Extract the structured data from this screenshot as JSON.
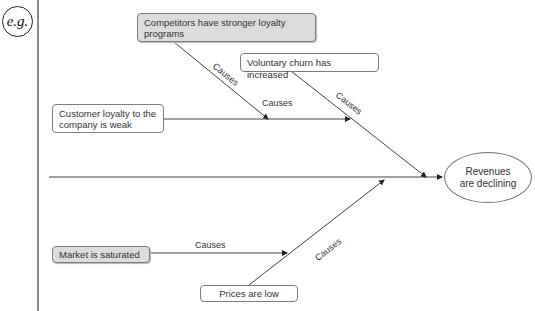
{
  "badge": {
    "text": "e.g."
  },
  "diagram": {
    "type": "fishbone",
    "effect": "Revenues are declining",
    "causes": [
      {
        "id": "competitors",
        "text": "Competitors have stronger loyalty programs",
        "style": "gray"
      },
      {
        "id": "churn",
        "text": "Voluntary churn has increased",
        "style": "white"
      },
      {
        "id": "loyalty",
        "text": "Customer loyalty to the company is weak",
        "style": "white"
      },
      {
        "id": "market",
        "text": "Market is saturated",
        "style": "gray"
      },
      {
        "id": "prices",
        "text": "Prices are low",
        "style": "white"
      }
    ],
    "edge_labels": {
      "competitors_to_loyalty": "Causes",
      "loyalty_to_churn": "Causes",
      "churn_to_effect": "Causes",
      "market_to_prices": "Causes",
      "prices_to_effect": "Causes"
    },
    "colors": {
      "line": "#333333",
      "gray_box": "#dcdcdc",
      "border": "#7d7d7d"
    }
  }
}
